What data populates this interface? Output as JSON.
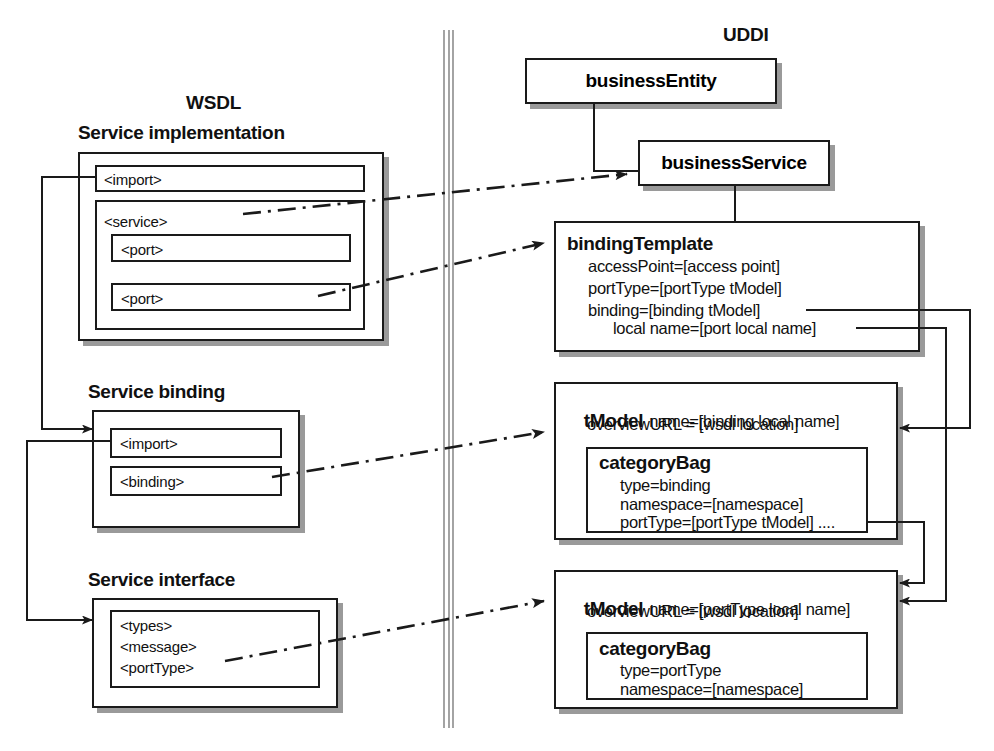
{
  "diagram": {
    "title_left": "WSDL",
    "title_right": "UDDI"
  },
  "wsdl": {
    "groups": [
      {
        "id": "service-implementation",
        "title": "Service implementation",
        "items": [
          "<import>",
          "<service>",
          "<port>",
          "<port>"
        ]
      },
      {
        "id": "service-binding",
        "title": "Service binding",
        "items": [
          "<import>",
          "<binding>"
        ]
      },
      {
        "id": "service-interface",
        "title": "Service interface",
        "items": [
          "<types>",
          "<message>",
          "<portType>"
        ]
      }
    ],
    "si_import": "<import>",
    "si_service": "<service>",
    "si_port_1": "<port>",
    "si_port_2": "<port>",
    "sb_import": "<import>",
    "sb_binding": "<binding>",
    "sif_types": "<types>",
    "sif_message": "<message>",
    "sif_porttype": "<portType>"
  },
  "uddi": {
    "business_entity": "businessEntity",
    "business_service": "businessService",
    "binding_template": {
      "title": "bindingTemplate",
      "lines": [
        "accessPoint=[access point]",
        "portType=[portType tModel]",
        "binding=[binding tModel]",
        "local name=[port local name]"
      ],
      "line_1": "accessPoint=[access point]",
      "line_2": "portType=[portType tModel]",
      "line_3": "binding=[binding tModel]",
      "line_4": "local name=[port local name]"
    },
    "tmodel_binding": {
      "title": "tModel",
      "name": "name=[binding local name]",
      "overview": "overviewURL = [wsdl location]",
      "category_bag_title": "categoryBag",
      "cb_line_1": "type=binding",
      "cb_line_2": "namespace=[namespace]",
      "cb_line_3": "portType=[portType tModel] ...."
    },
    "tmodel_porttype": {
      "title": "tModel",
      "name": "name=[portType local name]",
      "overview": "overviewURL = [wsdl location]",
      "category_bag_title": "categoryBag",
      "cb_line_1": "type=portType",
      "cb_line_2": "namespace=[namespace]"
    }
  },
  "colors": {
    "ink": "#1a1a1a",
    "shadow": "#9a9a9a",
    "divider": "#8d8d8d",
    "paper": "#ffffff"
  }
}
